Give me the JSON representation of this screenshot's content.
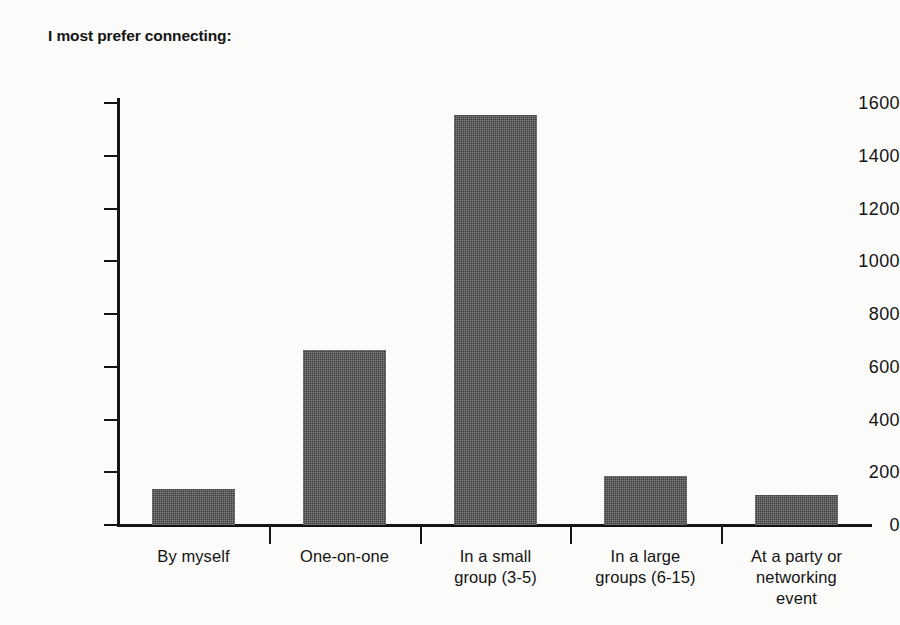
{
  "chart_data": {
    "type": "bar",
    "title": "I most prefer connecting:",
    "xlabel": "",
    "ylabel": "",
    "ylim": [
      0,
      1600
    ],
    "yticks": [
      0,
      200,
      400,
      600,
      800,
      1000,
      1200,
      1400,
      1600
    ],
    "ytick_labels": [
      "0",
      "200",
      "400",
      "600",
      "800",
      "1000",
      "1200",
      "1400",
      "1600"
    ],
    "grid": false,
    "legend": "none",
    "bar_color": "#3f3f3f",
    "background_color": "#fbfbfa",
    "axis_color": "#141414",
    "categories": [
      "By myself",
      "One-on-one",
      "In a small group (3-5)",
      "In a large groups (6-15)",
      "At a party or networking event"
    ],
    "category_lines": [
      [
        "By myself"
      ],
      [
        "One-on-one"
      ],
      [
        "In a small",
        "group (3-5)"
      ],
      [
        "In a large",
        "groups (6-15)"
      ],
      [
        "At a party or",
        "networking",
        "event"
      ]
    ],
    "values": [
      136,
      663,
      1556,
      186,
      112
    ]
  }
}
